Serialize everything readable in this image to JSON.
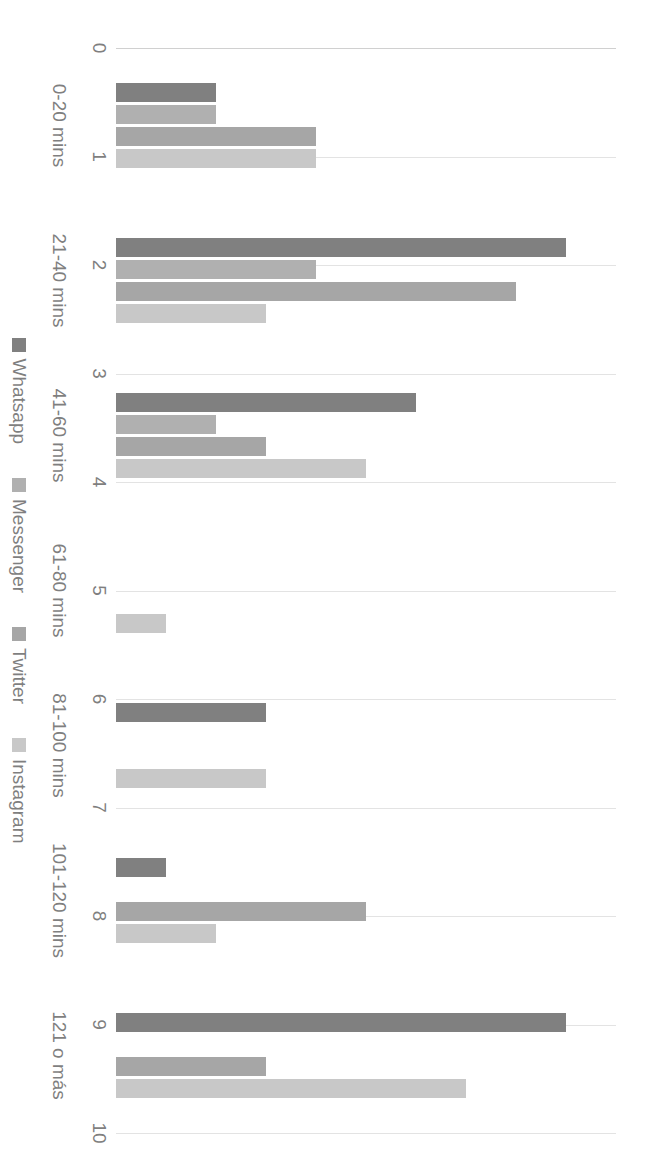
{
  "chart_data": {
    "type": "bar",
    "orientation": "vertical-rotated-90ccw",
    "title": "",
    "xlabel": "",
    "ylabel": "",
    "ylim": [
      0,
      10
    ],
    "ytick_step": 1,
    "grid": true,
    "legend_position": "bottom",
    "categories": [
      "0-20 mins",
      "21-40 mins",
      "41-60 mins",
      "61-80 mins",
      "81-100 mins",
      "101-120 mins",
      "121 o más"
    ],
    "yticks": [
      "0",
      "1",
      "2",
      "3",
      "4",
      "5",
      "6",
      "7",
      "8",
      "9",
      "10"
    ],
    "series": [
      {
        "name": "Whatsapp",
        "color": "#808080",
        "values": [
          2,
          9,
          6,
          0,
          3,
          1,
          9
        ]
      },
      {
        "name": "Messenger",
        "color": "#b0b0b0",
        "values": [
          2,
          4,
          2,
          0,
          0,
          0,
          0
        ]
      },
      {
        "name": "Twitter",
        "color": "#a6a6a6",
        "values": [
          4,
          8,
          3,
          0,
          0,
          5,
          3
        ]
      },
      {
        "name": "Instagram",
        "color": "#c8c8c8",
        "values": [
          4,
          3,
          5,
          1,
          3,
          2,
          7
        ]
      }
    ]
  }
}
